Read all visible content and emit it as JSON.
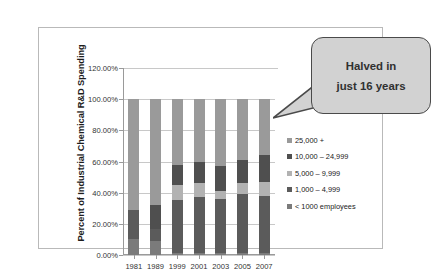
{
  "chart_data": {
    "type": "bar",
    "subtype": "stacked-column-100",
    "title": "",
    "xlabel": "",
    "ylabel": "Percent of Industrial Chemical R&D Spending",
    "categories": [
      "1981",
      "1989",
      "1999",
      "2001",
      "2003",
      "2005",
      "2007"
    ],
    "ylim": [
      0,
      120
    ],
    "ytick_labels": [
      "0.00%",
      "20.00%",
      "40.00%",
      "60.00%",
      "80.00%",
      "100.00%",
      "120.00%"
    ],
    "ytick_values": [
      0,
      20,
      40,
      60,
      80,
      100,
      120
    ],
    "grid": true,
    "legend_position": "right",
    "series": [
      {
        "name": "< 1000 employees",
        "color": "#7b7b7b",
        "values": [
          10,
          9,
          1,
          1,
          1,
          1,
          1
        ]
      },
      {
        "name": "1,000 – 4,999",
        "color": "#5b5b5b",
        "values": [
          19,
          8,
          34,
          36,
          35,
          38,
          37
        ]
      },
      {
        "name": "5,000 – 9,999",
        "color": "#b2b2b2",
        "values": [
          0,
          0,
          10,
          9,
          5,
          7,
          9
        ]
      },
      {
        "name": "10,000 – 24,999",
        "color": "#4f4f4f",
        "values": [
          0,
          15,
          13,
          14,
          16,
          15,
          17
        ]
      },
      {
        "name": "25,000 +",
        "color": "#9a9a9a",
        "values": [
          71,
          68,
          42,
          40,
          43,
          39,
          36
        ]
      }
    ],
    "annotations": [
      {
        "name": "callout",
        "lines": [
          "Halved in",
          "just 16 years"
        ]
      }
    ]
  },
  "legend": {
    "items": [
      {
        "label": "25,000 +",
        "color": "#9a9a9a"
      },
      {
        "label": "10,000 – 24,999",
        "color": "#4f4f4f"
      },
      {
        "label": "5,000 – 9,999",
        "color": "#b2b2b2"
      },
      {
        "label": "1,000 – 4,999",
        "color": "#5b5b5b"
      },
      {
        "label": "< 1000 employees",
        "color": "#7b7b7b"
      }
    ]
  },
  "callout": {
    "line1": "Halved in",
    "line2": "just 16 years"
  },
  "colors": {
    "frame_border": "#b9b9b9",
    "gridline": "#c8c8c8",
    "axis": "#9a9a9a",
    "callout_fill": "#d2d2d2",
    "callout_border": "#4a4a4a",
    "text": "#333333"
  }
}
